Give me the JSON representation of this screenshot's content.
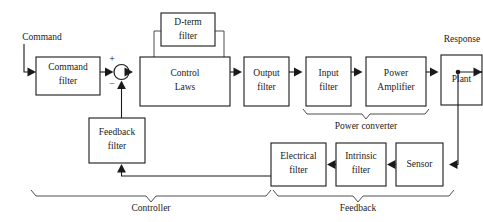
{
  "diagram": {
    "colors": {
      "background": "#ffffff",
      "line": "#1a1a1a",
      "text": "#1a1a1a",
      "brace": "#3a3a3a"
    },
    "blocks": [
      {
        "id": "command-filter",
        "line1": "Command",
        "line2": "filter"
      },
      {
        "id": "control-laws",
        "line1": "Control",
        "line2": "Laws"
      },
      {
        "id": "d-term-filter",
        "line1": "D-term",
        "line2": "filter"
      },
      {
        "id": "output-filter",
        "line1": "Output",
        "line2": "filter"
      },
      {
        "id": "input-filter",
        "line1": "Input",
        "line2": "filter"
      },
      {
        "id": "power-amplifier",
        "line1": "Power",
        "line2": "Amplifier"
      },
      {
        "id": "plant",
        "line1": "Plant",
        "line2": ""
      },
      {
        "id": "sensor",
        "line1": "Sensor",
        "line2": ""
      },
      {
        "id": "intrinsic-filter",
        "line1": "Intrinsic",
        "line2": "filter"
      },
      {
        "id": "electrical-filter",
        "line1": "Electrical",
        "line2": "filter"
      },
      {
        "id": "feedback-filter",
        "line1": "Feedback",
        "line2": "filter"
      }
    ],
    "signals": {
      "command": "Command",
      "response": "Response"
    },
    "summing_junction": {
      "plus": "+",
      "minus": "−"
    },
    "groups": [
      {
        "id": "power-converter",
        "label": "Power converter"
      },
      {
        "id": "controller",
        "label": "Controller"
      },
      {
        "id": "feedback",
        "label": "Feedback"
      }
    ]
  }
}
